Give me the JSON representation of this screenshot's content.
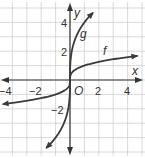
{
  "chart_data": {
    "type": "line",
    "title": "",
    "xlabel": "x",
    "ylabel": "y",
    "origin_label": "O",
    "xlim": [
      -5,
      5
    ],
    "ylim": [
      -5.5,
      5.5
    ],
    "grid": true,
    "x_ticks": [
      "-4",
      "-2",
      "2",
      "4"
    ],
    "y_ticks": [
      "4",
      "2",
      "-2"
    ],
    "series": [
      {
        "name": "f",
        "label": "f",
        "expression": "cube root of x",
        "points": [
          [
            -5,
            -1.71
          ],
          [
            -4,
            -1.59
          ],
          [
            -2,
            -1.26
          ],
          [
            -1,
            -1
          ],
          [
            -0.5,
            -0.79
          ],
          [
            0,
            0
          ],
          [
            0.5,
            0.79
          ],
          [
            1,
            1
          ],
          [
            2,
            1.26
          ],
          [
            4,
            1.59
          ],
          [
            4.8,
            1.69
          ]
        ]
      },
      {
        "name": "g",
        "label": "g",
        "expression": "4 times cube root of x",
        "points": [
          [
            -1.7,
            -4.77
          ],
          [
            -1,
            -4
          ],
          [
            -0.5,
            -3.17
          ],
          [
            -0.1,
            -1.86
          ],
          [
            0,
            0
          ],
          [
            0.1,
            1.86
          ],
          [
            0.5,
            3.17
          ],
          [
            1,
            4
          ],
          [
            1.7,
            4.77
          ]
        ]
      }
    ]
  },
  "labels": {
    "x_axis": "x",
    "y_axis": "y",
    "origin": "O",
    "f": "f",
    "g": "g",
    "xt_m4": "−4",
    "xt_m2": "−2",
    "xt_2": "2",
    "xt_4": "4",
    "yt_4": "4",
    "yt_2": "2",
    "yt_m2": "−2"
  }
}
